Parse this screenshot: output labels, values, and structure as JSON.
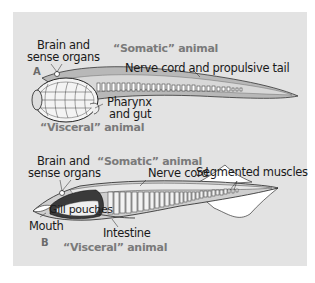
{
  "figure": {
    "background_color": "#e3e3e3",
    "category_text_color": "#7a7a7a",
    "label_text_color": "#1a1a1a"
  },
  "panel_a": {
    "letter": "A",
    "somatic_label": "“Somatic” animal",
    "visceral_label": "“Visceral” animal",
    "labels": {
      "brain_line1": "Brain and",
      "brain_line2": "sense organs",
      "nerve_cord": "Nerve cord and propulsive tail",
      "pharynx_line1": "Pharynx",
      "pharynx_line2": "and gut"
    }
  },
  "panel_b": {
    "letter": "B",
    "somatic_label": "“Somatic” animal",
    "visceral_label": "“Visceral” animal",
    "labels": {
      "brain_line1": "Brain and",
      "brain_line2": "sense organs",
      "nerve_cord": "Nerve cord",
      "segmented_muscles": "Segmented muscles",
      "gill_pouches": "Gill pouches",
      "mouth": "Mouth",
      "intestine": "Intestine"
    }
  }
}
